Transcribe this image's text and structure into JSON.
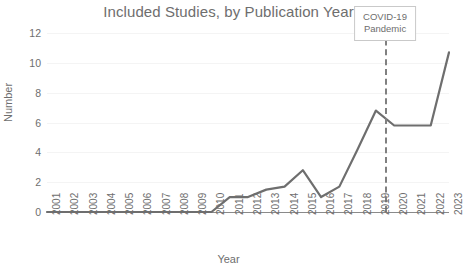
{
  "chart_data": {
    "type": "line",
    "title": "Included Studies, by Publication Year",
    "xlabel": "Year",
    "ylabel": "Number",
    "grid": true,
    "legend": "none",
    "line_color": "#6e6e6e",
    "categories": [
      2001,
      2002,
      2003,
      2004,
      2005,
      2006,
      2007,
      2008,
      2009,
      2010,
      2011,
      2012,
      2013,
      2014,
      2015,
      2016,
      2017,
      2018,
      2019,
      2020,
      2021,
      2022,
      2023
    ],
    "x": [
      "2001",
      "2002",
      "2003",
      "2004",
      "2005",
      "2006",
      "2007",
      "2008",
      "2009",
      "2010",
      "2011",
      "2012",
      "2013",
      "2014",
      "2015",
      "2016",
      "2017",
      "2018",
      "2019",
      "2020",
      "2021",
      "2022",
      "2023"
    ],
    "values": [
      0,
      0,
      0,
      0,
      0,
      0,
      0,
      0,
      0,
      0,
      1,
      1,
      1.5,
      1.7,
      2.8,
      1,
      1.7,
      4.2,
      6.8,
      5.8,
      5.8,
      5.8,
      10.7
    ],
    "xlim": [
      2001,
      2023
    ],
    "ylim": [
      0,
      12
    ],
    "yticks": [
      0,
      2,
      4,
      6,
      8,
      10,
      12
    ],
    "ytick_labels": [
      "0",
      "2",
      "4",
      "6",
      "8",
      "10",
      "12"
    ],
    "xtick_labels": [
      "2001",
      "2002",
      "2003",
      "2004",
      "2005",
      "2006",
      "2007",
      "2008",
      "2009",
      "2010",
      "2011",
      "2012",
      "2013",
      "2014",
      "2015",
      "2016",
      "2017",
      "2018",
      "2019",
      "2020",
      "2021",
      "2022",
      "2023"
    ],
    "annotations": [
      {
        "name": "covid-pandemic",
        "line1": "COVID-19",
        "line2": "Pandemic",
        "x_value": 2019.5,
        "style": "dashed-vline-with-label-box"
      }
    ]
  }
}
